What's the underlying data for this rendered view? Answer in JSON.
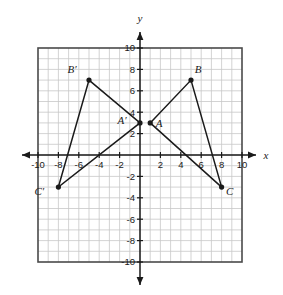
{
  "figure": {
    "axis_labels": {
      "x": "x",
      "y": "y"
    },
    "colors": {
      "grid_minor": "#c8c8c8",
      "grid_border": "#4a4a4a",
      "axis": "#1a1a1a",
      "shape_stroke": "#1a1a1a",
      "vertex_fill": "#1a1a1a",
      "background": "#ffffff"
    }
  },
  "chart_data": {
    "type": "scatter",
    "title": "",
    "xlabel": "x",
    "ylabel": "y",
    "xlim": [
      -10,
      10
    ],
    "ylim": [
      -10,
      10
    ],
    "grid": true,
    "grid_step": 1,
    "tick_step": 2,
    "legend": "none",
    "xticks": [
      -10,
      -8,
      -6,
      -4,
      -2,
      2,
      4,
      6,
      8,
      10
    ],
    "yticks": [
      10,
      8,
      6,
      4,
      2,
      -2,
      -4,
      -6,
      -8,
      -10
    ],
    "xtick_labels": [
      "-10",
      "-8",
      "-6",
      "-4",
      "-2",
      "2",
      "4",
      "6",
      "8",
      "10"
    ],
    "ytick_labels": [
      "10",
      "8",
      "6",
      "4",
      "2",
      "-2",
      "-4",
      "-6",
      "-8",
      "-10"
    ],
    "series": [
      {
        "name": "Triangle ABC",
        "closed": true,
        "points": [
          {
            "label": "A",
            "x": 1,
            "y": 3,
            "label_dx": 9,
            "label_dy": 4
          },
          {
            "label": "B",
            "x": 5,
            "y": 7,
            "label_dx": 7,
            "label_dy": -7
          },
          {
            "label": "C",
            "x": 8,
            "y": -3,
            "label_dx": 8,
            "label_dy": 8
          }
        ]
      },
      {
        "name": "Triangle A'B'C'",
        "closed": true,
        "points": [
          {
            "label": "A′",
            "x": 0,
            "y": 3,
            "label_dx": -18,
            "label_dy": 1
          },
          {
            "label": "B′",
            "x": -5,
            "y": 7,
            "label_dx": -17,
            "label_dy": -7
          },
          {
            "label": "C′",
            "x": -8,
            "y": -3,
            "label_dx": -19,
            "label_dy": 8
          }
        ]
      }
    ]
  }
}
